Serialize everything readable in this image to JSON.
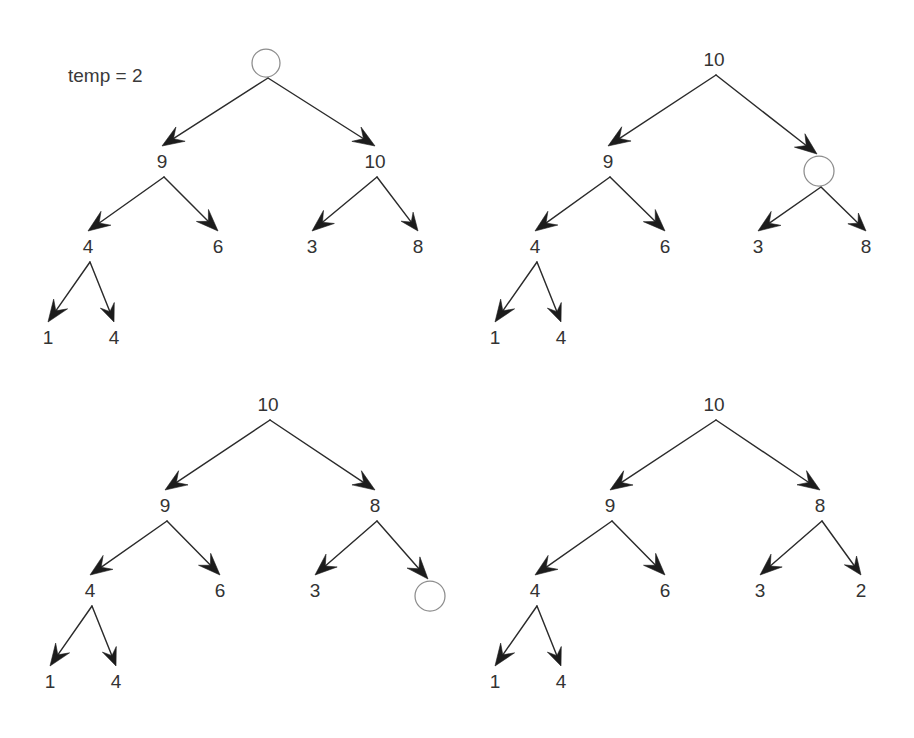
{
  "figure": {
    "background_color": "#ffffff",
    "line_color": "#2b2b2b",
    "arrow_fill": "#1c1c1c",
    "text_color": "#333333",
    "hole_stroke_color": "#8d8d8d",
    "annotations": [
      {
        "name": "temp-annotation",
        "text": "temp = 2",
        "x": 68,
        "y": 82
      }
    ]
  },
  "trees": [
    {
      "name": "tree-step-1",
      "nodes": [
        {
          "id": "t1-root",
          "label": "",
          "value": null,
          "x": 266,
          "y": 63,
          "hole": true,
          "radius": 14
        },
        {
          "id": "t1-n9",
          "label": "9",
          "value": 9,
          "x": 162,
          "y": 168,
          "hole": false
        },
        {
          "id": "t1-n10",
          "label": "10",
          "value": 10,
          "x": 375,
          "y": 168,
          "hole": false
        },
        {
          "id": "t1-n4",
          "label": "4",
          "value": 4,
          "x": 88,
          "y": 253,
          "hole": false
        },
        {
          "id": "t1-n6",
          "label": "6",
          "value": 6,
          "x": 218,
          "y": 253,
          "hole": false
        },
        {
          "id": "t1-n3",
          "label": "3",
          "value": 3,
          "x": 312,
          "y": 253,
          "hole": false
        },
        {
          "id": "t1-n8",
          "label": "8",
          "value": 8,
          "x": 418,
          "y": 253,
          "hole": false
        },
        {
          "id": "t1-n1b",
          "label": "1",
          "value": 1,
          "x": 48,
          "y": 344,
          "hole": false
        },
        {
          "id": "t1-n4b",
          "label": "4",
          "value": 4,
          "x": 114,
          "y": 344,
          "hole": false
        }
      ],
      "edges": [
        {
          "from": "t1-root",
          "to": "t1-n9"
        },
        {
          "from": "t1-root",
          "to": "t1-n10"
        },
        {
          "from": "t1-n9",
          "to": "t1-n4"
        },
        {
          "from": "t1-n9",
          "to": "t1-n6"
        },
        {
          "from": "t1-n10",
          "to": "t1-n3"
        },
        {
          "from": "t1-n10",
          "to": "t1-n8"
        },
        {
          "from": "t1-n4",
          "to": "t1-n1b"
        },
        {
          "from": "t1-n4",
          "to": "t1-n4b"
        }
      ]
    },
    {
      "name": "tree-step-2",
      "nodes": [
        {
          "id": "t2-root",
          "label": "10",
          "value": 10,
          "x": 714,
          "y": 66,
          "hole": false
        },
        {
          "id": "t2-n9",
          "label": "9",
          "value": 9,
          "x": 608,
          "y": 168,
          "hole": false
        },
        {
          "id": "t2-hole",
          "label": "",
          "value": null,
          "x": 819,
          "y": 171,
          "hole": true,
          "radius": 15
        },
        {
          "id": "t2-n4",
          "label": "4",
          "value": 4,
          "x": 535,
          "y": 253,
          "hole": false
        },
        {
          "id": "t2-n6",
          "label": "6",
          "value": 6,
          "x": 665,
          "y": 253,
          "hole": false
        },
        {
          "id": "t2-n3",
          "label": "3",
          "value": 3,
          "x": 758,
          "y": 253,
          "hole": false
        },
        {
          "id": "t2-n8",
          "label": "8",
          "value": 8,
          "x": 866,
          "y": 253,
          "hole": false
        },
        {
          "id": "t2-n1b",
          "label": "1",
          "value": 1,
          "x": 495,
          "y": 344,
          "hole": false
        },
        {
          "id": "t2-n4b",
          "label": "4",
          "value": 4,
          "x": 561,
          "y": 344,
          "hole": false
        }
      ],
      "edges": [
        {
          "from": "t2-root",
          "to": "t2-n9"
        },
        {
          "from": "t2-root",
          "to": "t2-hole"
        },
        {
          "from": "t2-n9",
          "to": "t2-n4"
        },
        {
          "from": "t2-n9",
          "to": "t2-n6"
        },
        {
          "from": "t2-hole",
          "to": "t2-n3"
        },
        {
          "from": "t2-hole",
          "to": "t2-n8"
        },
        {
          "from": "t2-n4",
          "to": "t2-n1b"
        },
        {
          "from": "t2-n4",
          "to": "t2-n4b"
        }
      ]
    },
    {
      "name": "tree-step-3",
      "nodes": [
        {
          "id": "t3-root",
          "label": "10",
          "value": 10,
          "x": 268,
          "y": 411,
          "hole": false
        },
        {
          "id": "t3-n9",
          "label": "9",
          "value": 9,
          "x": 165,
          "y": 512,
          "hole": false
        },
        {
          "id": "t3-n8",
          "label": "8",
          "value": 8,
          "x": 375,
          "y": 512,
          "hole": false
        },
        {
          "id": "t3-n4",
          "label": "4",
          "value": 4,
          "x": 90,
          "y": 597,
          "hole": false
        },
        {
          "id": "t3-n6",
          "label": "6",
          "value": 6,
          "x": 220,
          "y": 597,
          "hole": false
        },
        {
          "id": "t3-n3",
          "label": "3",
          "value": 3,
          "x": 315,
          "y": 597,
          "hole": false
        },
        {
          "id": "t3-hole",
          "label": "",
          "value": null,
          "x": 430,
          "y": 596,
          "hole": true,
          "radius": 15
        },
        {
          "id": "t3-n1b",
          "label": "1",
          "value": 1,
          "x": 50,
          "y": 688,
          "hole": false
        },
        {
          "id": "t3-n4b",
          "label": "4",
          "value": 4,
          "x": 116,
          "y": 688,
          "hole": false
        }
      ],
      "edges": [
        {
          "from": "t3-root",
          "to": "t3-n9"
        },
        {
          "from": "t3-root",
          "to": "t3-n8"
        },
        {
          "from": "t3-n9",
          "to": "t3-n4"
        },
        {
          "from": "t3-n9",
          "to": "t3-n6"
        },
        {
          "from": "t3-n8",
          "to": "t3-n3"
        },
        {
          "from": "t3-n8",
          "to": "t3-hole"
        },
        {
          "from": "t3-n4",
          "to": "t3-n1b"
        },
        {
          "from": "t3-n4",
          "to": "t3-n4b"
        }
      ]
    },
    {
      "name": "tree-step-4",
      "nodes": [
        {
          "id": "t4-root",
          "label": "10",
          "value": 10,
          "x": 714,
          "y": 411,
          "hole": false
        },
        {
          "id": "t4-n9",
          "label": "9",
          "value": 9,
          "x": 610,
          "y": 512,
          "hole": false
        },
        {
          "id": "t4-n8",
          "label": "8",
          "value": 8,
          "x": 820,
          "y": 512,
          "hole": false
        },
        {
          "id": "t4-n4",
          "label": "4",
          "value": 4,
          "x": 535,
          "y": 597,
          "hole": false
        },
        {
          "id": "t4-n6",
          "label": "6",
          "value": 6,
          "x": 665,
          "y": 597,
          "hole": false
        },
        {
          "id": "t4-n3",
          "label": "3",
          "value": 3,
          "x": 760,
          "y": 597,
          "hole": false
        },
        {
          "id": "t4-n2",
          "label": "2",
          "value": 2,
          "x": 861,
          "y": 597,
          "hole": false
        },
        {
          "id": "t4-n1b",
          "label": "1",
          "value": 1,
          "x": 495,
          "y": 688,
          "hole": false
        },
        {
          "id": "t4-n4b",
          "label": "4",
          "value": 4,
          "x": 561,
          "y": 688,
          "hole": false
        }
      ],
      "edges": [
        {
          "from": "t4-root",
          "to": "t4-n9"
        },
        {
          "from": "t4-root",
          "to": "t4-n8"
        },
        {
          "from": "t4-n9",
          "to": "t4-n4"
        },
        {
          "from": "t4-n9",
          "to": "t4-n6"
        },
        {
          "from": "t4-n8",
          "to": "t4-n3"
        },
        {
          "from": "t4-n8",
          "to": "t4-n2"
        },
        {
          "from": "t4-n4",
          "to": "t4-n1b"
        },
        {
          "from": "t4-n4",
          "to": "t4-n4b"
        }
      ]
    }
  ]
}
